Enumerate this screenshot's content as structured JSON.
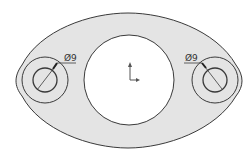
{
  "drawing": {
    "type": "cad-sketch",
    "colors": {
      "part_fill": "#e4e4e4",
      "line": "#3a3a3a",
      "background": "#ffffff",
      "hole_fill": "#ffffff"
    },
    "dimensions": [
      {
        "label": "Ø9",
        "feature": "left-boss-hole"
      },
      {
        "label": "Ø9",
        "feature": "right-boss-hole"
      }
    ]
  }
}
